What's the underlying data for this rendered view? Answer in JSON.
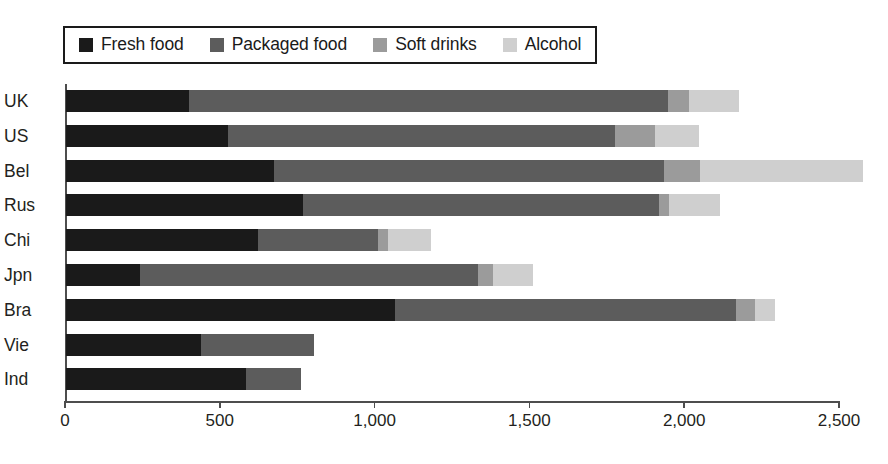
{
  "chart_data": {
    "type": "bar",
    "orientation": "horizontal",
    "stacked": true,
    "title": "",
    "subtitle": "",
    "xlabel": "",
    "ylabel": "",
    "xlim": [
      0,
      2500
    ],
    "xticks": [
      0,
      500,
      1000,
      1500,
      2000,
      2500
    ],
    "xtick_labels": [
      "0",
      "500",
      "1,000",
      "1,500",
      "2,000",
      "2,500"
    ],
    "grid": false,
    "legend_position": "top-left",
    "categories": [
      "UK",
      "US",
      "Bel",
      "Rus",
      "Chi",
      "Jpn",
      "Bra",
      "Vie",
      "Ind"
    ],
    "series": [
      {
        "name": "Fresh food",
        "color": "#1a1a1a",
        "values": [
          398,
          522,
          673,
          767,
          621,
          238,
          1064,
          437,
          582
        ]
      },
      {
        "name": "Packaged food",
        "color": "#5c5c5c",
        "values": [
          1548,
          1250,
          1258,
          1148,
          388,
          1093,
          1101,
          365,
          178
        ]
      },
      {
        "name": "Soft drinks",
        "color": "#9b9b9b",
        "values": [
          65,
          129,
          116,
          32,
          32,
          48,
          61,
          0,
          0
        ]
      },
      {
        "name": "Alcohol",
        "color": "#cfcfcf",
        "values": [
          162,
          142,
          528,
          164,
          139,
          129,
          63,
          0,
          0
        ]
      }
    ],
    "totals": [
      2173,
      2043,
      2575,
      2111,
      1180,
      1508,
      2289,
      802,
      760
    ]
  },
  "legend": {
    "items": [
      {
        "label": "Fresh food",
        "color": "#1a1a1a",
        "swatch": "legend-swatch-fresh-food"
      },
      {
        "label": "Packaged food",
        "color": "#5c5c5c",
        "swatch": "legend-swatch-packaged-food"
      },
      {
        "label": "Soft drinks",
        "color": "#9b9b9b",
        "swatch": "legend-swatch-soft-drinks"
      },
      {
        "label": "Alcohol",
        "color": "#cfcfcf",
        "swatch": "legend-swatch-alcohol"
      }
    ]
  },
  "colors": {
    "fresh_food": "#1a1a1a",
    "packaged_food": "#5c5c5c",
    "soft_drinks": "#9b9b9b",
    "alcohol": "#cfcfcf",
    "axis": "#4d4d4d",
    "text": "#231f20",
    "background": "#ffffff"
  }
}
